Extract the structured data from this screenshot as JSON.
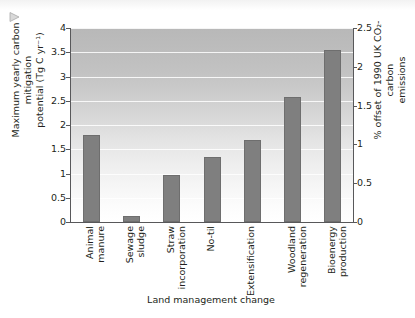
{
  "figure": {
    "marker_icon": "triangle-marker-icon",
    "background_color": "#ffffff",
    "bar_color": "#7f7f7f",
    "axis_color": "#58585a"
  },
  "chart_data": {
    "type": "bar",
    "title": "",
    "xlabel": "Land management change",
    "ylabel": "Maximum yearly carbon mitigation potential (Tg C yr⁻¹)",
    "ylabel_line1": "Maximum yearly carbon mitigation",
    "ylabel_line2": "potential (Tg C yr⁻¹)",
    "y2label": "% offset of 1990 UK CO₂-carbon emissions",
    "y2label_line1": "% offset of 1990 UK CO₂-carbon",
    "y2label_line2": "emissions",
    "categories": [
      "Animal manure",
      "Sewage sludge",
      "Straw incorporation",
      "No-til",
      "Extensification",
      "Woodland regeneration",
      "Bioenergy production"
    ],
    "category_lines": [
      [
        "Animal",
        "manure"
      ],
      [
        "Sewage",
        "sludge"
      ],
      [
        "Straw",
        "incorporation"
      ],
      [
        "No-til",
        ""
      ],
      [
        "Extensification",
        ""
      ],
      [
        "Woodland",
        "regeneration"
      ],
      [
        "Bioenergy",
        "production"
      ]
    ],
    "values": [
      1.8,
      0.12,
      0.97,
      1.35,
      1.7,
      2.58,
      3.55
    ],
    "ylim": [
      0,
      4
    ],
    "yticks": [
      0,
      0.5,
      1,
      1.5,
      2,
      2.5,
      3,
      3.5,
      4
    ],
    "ytick_labels": [
      "0",
      "0.5",
      "1",
      "1.5",
      "2",
      "2.5",
      "3",
      "3.5",
      "4"
    ],
    "y2lim": [
      0,
      2.5
    ],
    "y2ticks": [
      0,
      0.5,
      1,
      1.5,
      2,
      2.5
    ],
    "y2tick_labels": [
      "0",
      "0.5",
      "1",
      "1.5",
      "2",
      "2.5"
    ],
    "grid": true,
    "legend": "none",
    "bar_color": "#7f7f7f"
  }
}
